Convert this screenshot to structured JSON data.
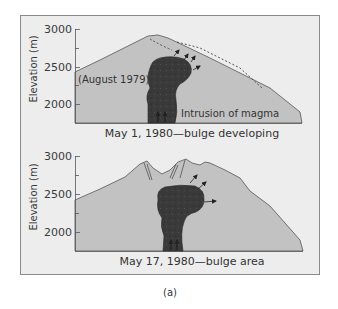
{
  "figure": {
    "sub_label": "(a)",
    "colors": {
      "frame_bg": "#ededed",
      "frame_border": "#8a8a8a",
      "mountain_fill": "#c2c2c2",
      "mountain_outline": "#555555",
      "magma_fill": "#3a3a3a",
      "arrow": "#222222"
    }
  },
  "panels": [
    {
      "y_axis_title": "Elevation (m)",
      "y_ticks": [
        "3000",
        "2500",
        "2000"
      ],
      "annotation_left": "(August 1979)",
      "annotation_magma": "Intrusion of magma",
      "caption": "May 1, 1980—bulge developing"
    },
    {
      "y_axis_title": "Elevation (m)",
      "y_ticks": [
        "3000",
        "2500",
        "2000"
      ],
      "caption": "May 17, 1980—bulge area"
    }
  ]
}
